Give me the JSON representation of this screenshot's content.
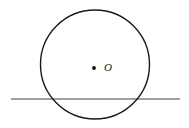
{
  "figure": {
    "background_color": "#ffffff",
    "width": 189,
    "height": 128,
    "center_label": "O",
    "labels": {
      "center_point_label": "O"
    },
    "colors": {
      "circle_stroke": "#1a1a1a",
      "line_stroke": "#808080",
      "center_dot_fill": "#111111",
      "label_text": "#1a1a1a"
    }
  },
  "chart_data": {
    "type": "diagram",
    "xlabel": "",
    "ylabel": "",
    "xlim": [
      0,
      189
    ],
    "ylim": [
      0,
      128
    ],
    "grid": false,
    "legend": null,
    "shapes": [
      {
        "name": "circle",
        "kind": "circle",
        "cx": 95,
        "cy": 64.5,
        "r": 54.5,
        "stroke": "#1a1a1a",
        "stroke_width": 1.4,
        "fill": "none"
      },
      {
        "name": "secant-line",
        "kind": "line",
        "x1": 11,
        "y1": 99,
        "x2": 180,
        "y2": 99,
        "stroke": "#808080",
        "stroke_width": 1.4
      },
      {
        "name": "center-dot",
        "kind": "point",
        "cx": 94,
        "cy": 68,
        "r": 1.9,
        "fill": "#111111"
      }
    ],
    "annotations": [
      {
        "name": "center-label",
        "text": "O",
        "x": 104,
        "y": 62,
        "style": "italic-serif",
        "font_size": 11
      }
    ]
  }
}
